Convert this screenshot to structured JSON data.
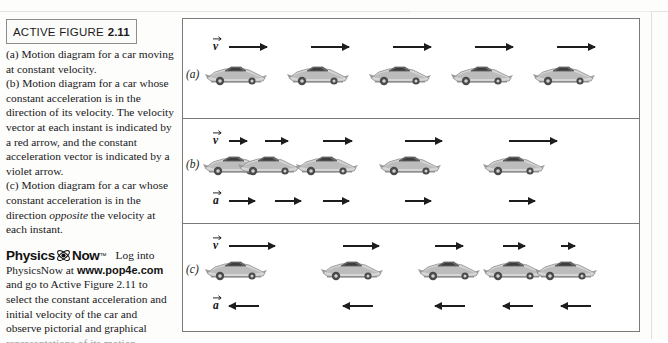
{
  "figure": {
    "title_main": "ACTIVE FIGURE",
    "title_number": "2.11",
    "caption_a": "(a) Motion diagram for a car moving at constant velocity.",
    "caption_b_part1": "(b) Motion diagram for a car whose constant acceleration is in the direction of its velocity. The velocity vector at each instant is indicated by a red arrow, and the constant acceleration vector is indicated by a violet arrow.",
    "caption_c_part1": "(c) Motion diagram for a car whose constant acceleration is in the direction ",
    "caption_c_emphasis": "opposite",
    "caption_c_part2": " the velocity at each instant."
  },
  "physicsnow": {
    "word1": "Physics",
    "word2": "Now",
    "trademark": "™",
    "atom_icon": "atom-icon",
    "tail_text": "Log into",
    "body_before_url": "PhysicsNow at ",
    "url": "www.pop4e.com",
    "body_after_url": " and go to Active Figure 2.11 to select the constant acceleration and initial velocity of the car and observe pictorial and graphical",
    "clipped_line": "representations of its motion."
  },
  "panels": [
    {
      "id": "panel-a",
      "label": "(a)",
      "velocity_symbol": "v",
      "show_velocity_symbol": true,
      "show_acceleration_row": false,
      "acceleration_symbol": "a",
      "cars": [
        {
          "x": 22
        },
        {
          "x": 104
        },
        {
          "x": 186
        },
        {
          "x": 268
        },
        {
          "x": 350
        }
      ],
      "velocity_arrows": [
        {
          "x": 46,
          "length": 38,
          "dir": "right"
        },
        {
          "x": 128,
          "length": 38,
          "dir": "right"
        },
        {
          "x": 210,
          "length": 38,
          "dir": "right"
        },
        {
          "x": 292,
          "length": 38,
          "dir": "right"
        },
        {
          "x": 374,
          "length": 38,
          "dir": "right"
        }
      ],
      "acceleration_arrows": []
    },
    {
      "id": "panel-b",
      "label": "(b)",
      "velocity_symbol": "v",
      "show_velocity_symbol": true,
      "show_acceleration_row": true,
      "acceleration_symbol": "a",
      "cars": [
        {
          "x": 20
        },
        {
          "x": 55
        },
        {
          "x": 113
        },
        {
          "x": 196
        },
        {
          "x": 300
        }
      ],
      "velocity_arrows": [
        {
          "x": 46,
          "length": 18,
          "dir": "right"
        },
        {
          "x": 82,
          "length": 23,
          "dir": "right"
        },
        {
          "x": 140,
          "length": 29,
          "dir": "right"
        },
        {
          "x": 222,
          "length": 37,
          "dir": "right"
        },
        {
          "x": 326,
          "length": 48,
          "dir": "right"
        }
      ],
      "acceleration_arrows": [
        {
          "x": 46,
          "length": 26,
          "dir": "right"
        },
        {
          "x": 92,
          "length": 26,
          "dir": "right"
        },
        {
          "x": 140,
          "length": 26,
          "dir": "right"
        },
        {
          "x": 222,
          "length": 26,
          "dir": "right"
        },
        {
          "x": 326,
          "length": 26,
          "dir": "right"
        }
      ]
    },
    {
      "id": "panel-c",
      "label": "(c)",
      "velocity_symbol": "v",
      "show_velocity_symbol": true,
      "show_acceleration_row": true,
      "acceleration_symbol": "a",
      "cars": [
        {
          "x": 22
        },
        {
          "x": 138
        },
        {
          "x": 235
        },
        {
          "x": 300
        },
        {
          "x": 352
        }
      ],
      "velocity_arrows": [
        {
          "x": 46,
          "length": 46,
          "dir": "right"
        },
        {
          "x": 160,
          "length": 36,
          "dir": "right"
        },
        {
          "x": 252,
          "length": 28,
          "dir": "right"
        },
        {
          "x": 320,
          "length": 22,
          "dir": "right"
        },
        {
          "x": 378,
          "length": 14,
          "dir": "right"
        }
      ],
      "acceleration_arrows": [
        {
          "x": 46,
          "length": 30,
          "dir": "left"
        },
        {
          "x": 160,
          "length": 30,
          "dir": "left"
        },
        {
          "x": 252,
          "length": 30,
          "dir": "left"
        },
        {
          "x": 320,
          "length": 30,
          "dir": "left"
        },
        {
          "x": 378,
          "length": 30,
          "dir": "left"
        }
      ]
    }
  ]
}
